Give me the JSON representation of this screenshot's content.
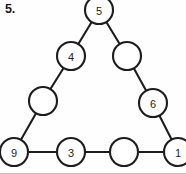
{
  "worksheet": {
    "problem_number": "5.",
    "background_color": "#fefefe",
    "ink_color": "#1d1d1d",
    "border_color": "#bdbdbd"
  },
  "diagram": {
    "type": "magic-triangle",
    "circle_radius": 14,
    "nodes": [
      {
        "id": "apex",
        "label": "5",
        "cx": 99,
        "cy": 10,
        "filled": true,
        "position": "top-vertex"
      },
      {
        "id": "left-upper",
        "label": "4",
        "cx": 71,
        "cy": 56,
        "filled": true,
        "position": "left-side-upper"
      },
      {
        "id": "left-lower",
        "label": "",
        "cx": 43,
        "cy": 101,
        "filled": false,
        "position": "left-side-lower"
      },
      {
        "id": "bottom-left",
        "label": "9",
        "cx": 14,
        "cy": 152,
        "filled": true,
        "position": "bottom-left-vertex"
      },
      {
        "id": "bottom-mid-1",
        "label": "3",
        "cx": 71,
        "cy": 152,
        "filled": true,
        "position": "bottom-side-left"
      },
      {
        "id": "bottom-mid-2",
        "label": "",
        "cx": 124,
        "cy": 152,
        "filled": false,
        "position": "bottom-side-right"
      },
      {
        "id": "bottom-right",
        "label": "1",
        "cx": 178,
        "cy": 152,
        "filled": true,
        "position": "bottom-right-vertex"
      },
      {
        "id": "right-lower",
        "label": "6",
        "cx": 153,
        "cy": 103,
        "filled": true,
        "position": "right-side-lower"
      },
      {
        "id": "right-upper",
        "label": "",
        "cx": 127,
        "cy": 56,
        "filled": false,
        "position": "right-side-upper"
      }
    ],
    "edges": [
      {
        "from": "apex",
        "to": "left-upper"
      },
      {
        "from": "left-upper",
        "to": "left-lower"
      },
      {
        "from": "left-lower",
        "to": "bottom-left"
      },
      {
        "from": "bottom-left",
        "to": "bottom-mid-1"
      },
      {
        "from": "bottom-mid-1",
        "to": "bottom-mid-2"
      },
      {
        "from": "bottom-mid-2",
        "to": "bottom-right"
      },
      {
        "from": "bottom-right",
        "to": "right-lower"
      },
      {
        "from": "right-lower",
        "to": "right-upper"
      },
      {
        "from": "right-upper",
        "to": "apex"
      }
    ]
  }
}
